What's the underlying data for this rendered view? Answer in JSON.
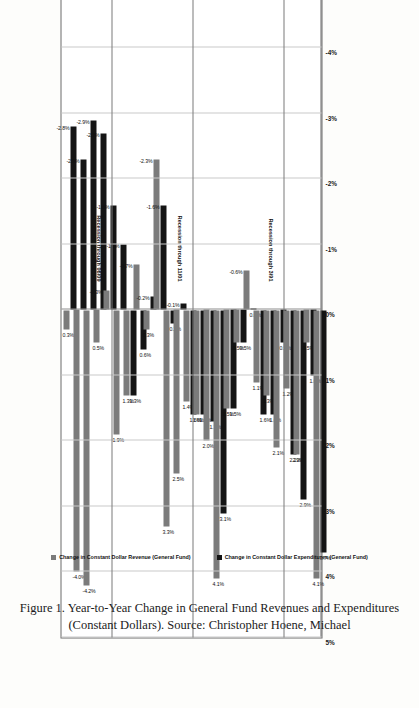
{
  "figure": {
    "caption": "Figure 1. Year-to-Year Change in General Fund Revenues and Expenditures (Constant Dollars). Source: Christopher Hoene, Michael"
  },
  "legend": {
    "position": "bottom",
    "entries": [
      {
        "label": "Change in Constant Dollar Revenue (General Fund)",
        "color": "#7b7b7b",
        "key": "revenue"
      },
      {
        "label": "Change in Constant Dollar Expenditures (General Fund)",
        "color": "#141414",
        "key": "expenditures"
      }
    ]
  },
  "annotations": {
    "recessions": [
      {
        "label": "Recession through 3/91",
        "after_year": "1990"
      },
      {
        "label": "Recession through 11/01",
        "after_year": "2000"
      },
      {
        "label": "Recession through 06/09",
        "after_year": "2008"
      }
    ]
  },
  "chart_data": {
    "type": "bar",
    "orientation": "horizontal",
    "title": "",
    "xlabel": "",
    "ylabel": "",
    "xlim": [
      -5,
      5
    ],
    "xticks": [
      "5%",
      "4%",
      "3%",
      "2%",
      "1%",
      "0%",
      "-1%",
      "-2%",
      "-3%",
      "-4%",
      "-5%"
    ],
    "xtick_values": [
      5,
      4,
      3,
      2,
      1,
      0,
      -1,
      -2,
      -3,
      -4,
      -5
    ],
    "grid": true,
    "categories": [
      "2012 (budget)",
      "2011",
      "2010",
      "2009",
      "2008",
      "2007",
      "2006",
      "2005",
      "2004",
      "2003",
      "2002",
      "2001",
      "2000",
      "1999",
      "1998",
      "1997",
      "1996",
      "1994",
      "1993",
      "1992",
      "1991",
      "1990",
      "1989",
      "1988",
      "1987",
      "1986"
    ],
    "series": [
      {
        "name": "Change in Constant Dollar Revenue (General Fund)",
        "key": "revenue",
        "color": "#7b7b7b",
        "values": [
          0.3,
          4.0,
          4.2,
          0.5,
          -0.3,
          1.9,
          1.3,
          -0.7,
          0.3,
          -2.3,
          3.3,
          2.5,
          1.4,
          1.6,
          2.0,
          4.1,
          1.5,
          0.5,
          -0.6,
          1.1,
          1.3,
          2.1,
          1.2,
          2.2,
          0.5,
          4.1
        ],
        "labels": [
          "0.3%",
          "-4.0%",
          "-4.2%",
          "0.5%",
          "-0.3%",
          "1.9%",
          "1.3%",
          "-0.7%",
          "0.3%",
          "-2.3%",
          "3.3%",
          "2.5%",
          "1.4%",
          "1.6%",
          "2.0%",
          "4.1%",
          "1.5%",
          "0.5%",
          "-0.6%",
          "1.1%",
          "1.3%",
          "2.1%",
          "1.2%",
          "2.2%",
          "0.5%",
          "4.1%"
        ]
      },
      {
        "name": "Change in Constant Dollar Expenditures (General Fund)",
        "key": "expenditures",
        "color": "#141414",
        "values": [
          -2.8,
          -2.3,
          -2.9,
          -2.7,
          -1.6,
          -1.0,
          1.3,
          0.6,
          -0.2,
          -1.6,
          0.2,
          -0.1,
          1.6,
          1.6,
          1.7,
          3.1,
          1.5,
          0.5,
          0.0,
          1.6,
          1.6,
          0.5,
          2.2,
          2.9,
          1.0,
          3.7
        ],
        "labels": [
          "-2.8%",
          "-2.3%",
          "-2.9%",
          "-2.7%",
          "-1.6%",
          "-1.0%",
          "1.3%",
          "0.6%",
          "-0.2%",
          "-1.6%",
          "0.2%",
          "-0.1%",
          "1.6%",
          "1.6%",
          "1.7%",
          "3.1%",
          "1.5%",
          "0.5%",
          "0.0%",
          "1.6%",
          "1.6%",
          "0.5%",
          "2.2%",
          "2.9%",
          "1.0%",
          "3.7%"
        ]
      }
    ]
  }
}
